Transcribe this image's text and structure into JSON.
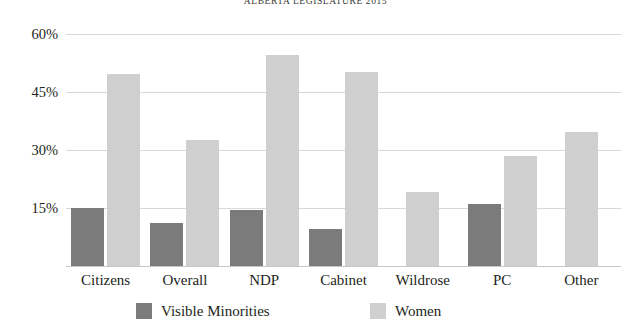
{
  "chart_data": {
    "type": "bar",
    "title": "ALBERTA LEGISLATURE 2015",
    "xlabel": "",
    "ylabel": "",
    "ylim": [
      0,
      63
    ],
    "yticks": [
      15,
      30,
      45,
      60
    ],
    "ytick_labels": [
      "15%",
      "30%",
      "45%",
      "60%"
    ],
    "grid": true,
    "legend_position": "bottom",
    "categories": [
      "Citizens",
      "Overall",
      "NDP",
      "Cabinet",
      "Wildrose",
      "PC",
      "Other"
    ],
    "series": [
      {
        "name": "Visible Minorities",
        "color": "#7b7b7b",
        "values": [
          15.0,
          11.0,
          14.5,
          9.5,
          null,
          16.0,
          null
        ]
      },
      {
        "name": "Women",
        "color": "#cfcfcf",
        "values": [
          49.5,
          32.5,
          54.5,
          50.0,
          19.0,
          28.5,
          34.5
        ]
      }
    ]
  },
  "legend": {
    "items": [
      {
        "label": "Visible Minorities",
        "color": "#7b7b7b"
      },
      {
        "label": "Women",
        "color": "#cfcfcf"
      }
    ]
  }
}
